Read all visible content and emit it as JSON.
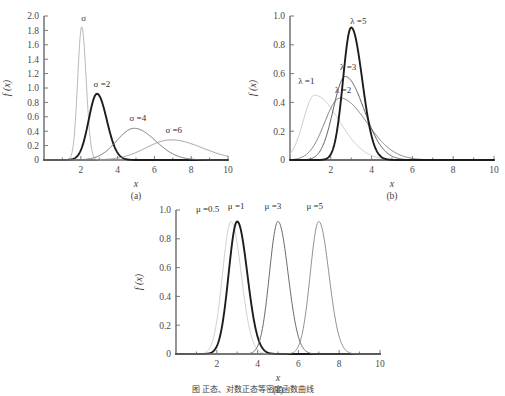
{
  "figure": {
    "caption": "图 正态、对数正态等密度函数曲线",
    "panels_order": [
      "a",
      "b",
      "c"
    ]
  },
  "chart_data": [
    {
      "id": "a",
      "type": "line",
      "title": "",
      "panel_label": "(a)",
      "xlabel": "x",
      "ylabel": "f (x)",
      "xlim": [
        0,
        10
      ],
      "ylim": [
        0,
        2.0
      ],
      "xticks": [
        2,
        4,
        6,
        8,
        10
      ],
      "xtick_labels": [
        "2",
        "4",
        "6",
        "8",
        "10"
      ],
      "yticks": [
        0,
        0.2,
        0.4,
        0.6,
        0.8,
        1.0,
        1.2,
        1.4,
        1.6,
        1.8,
        2.0
      ],
      "ytick_labels": [
        "0",
        "0.2",
        "0.4",
        "0.6",
        "0.8",
        "1.0",
        "1.2",
        "1.4",
        "1.6",
        "1.8",
        "2.0"
      ],
      "grid": false,
      "legend_position": "inline-annotations",
      "series": [
        {
          "name": "σ",
          "label": "σ",
          "peak_x": 2.05,
          "peak_y": 1.85,
          "width": 0.22,
          "skew": 0.1,
          "weight": 1.0,
          "color": "#b9b9b9",
          "label_x": 2.15,
          "label_y": 1.92
        },
        {
          "name": "σ =2",
          "label": "σ =2",
          "peak_x": 2.88,
          "peak_y": 0.92,
          "width": 0.45,
          "skew": 0.18,
          "weight": 1.9,
          "color": "#1d1d1d",
          "label_x": 3.15,
          "label_y": 1.0
        },
        {
          "name": "σ =4",
          "label": "σ =4",
          "peak_x": 4.9,
          "peak_y": 0.44,
          "width": 0.95,
          "skew": 0.22,
          "weight": 1.0,
          "color": "#6f6f6f",
          "label_x": 5.1,
          "label_y": 0.53
        },
        {
          "name": "σ =6",
          "label": "σ =6",
          "peak_x": 6.9,
          "peak_y": 0.28,
          "width": 1.35,
          "skew": 0.25,
          "weight": 0.9,
          "color": "#8f8f8f",
          "label_x": 7.05,
          "label_y": 0.36
        }
      ]
    },
    {
      "id": "b",
      "type": "line",
      "title": "",
      "panel_label": "(b)",
      "xlabel": "x",
      "ylabel": "f (x)",
      "xlim": [
        0,
        10
      ],
      "ylim": [
        0,
        1.0
      ],
      "xticks": [
        2,
        4,
        6,
        8,
        10
      ],
      "xtick_labels": [
        "2",
        "4",
        "6",
        "8",
        "10"
      ],
      "yticks": [
        0,
        0.2,
        0.4,
        0.6,
        0.8,
        1.0
      ],
      "ytick_labels": [
        "0",
        "0.2",
        "0.4",
        "0.6",
        "0.8",
        "1.0"
      ],
      "grid": false,
      "legend_position": "inline-annotations",
      "series": [
        {
          "name": "λ =1",
          "label": "λ =1",
          "peak_x": 1.2,
          "peak_y": 0.45,
          "width": 0.55,
          "skew": 1.2,
          "weight": 0.85,
          "color": "#c2c2c2",
          "label_x": 0.8,
          "label_y": 0.52
        },
        {
          "name": "λ =2",
          "label": "λ =2",
          "peak_x": 2.45,
          "peak_y": 0.43,
          "width": 0.75,
          "skew": 0.75,
          "weight": 1.0,
          "color": "#7b7b7b",
          "label_x": 2.6,
          "label_y": 0.46
        },
        {
          "name": "λ =3",
          "label": "λ =3",
          "peak_x": 2.7,
          "peak_y": 0.58,
          "width": 0.58,
          "skew": 0.6,
          "weight": 1.0,
          "color": "#5c5c5c",
          "label_x": 2.85,
          "label_y": 0.62
        },
        {
          "name": "λ =5",
          "label": "λ =5",
          "peak_x": 3.0,
          "peak_y": 0.92,
          "width": 0.4,
          "skew": 0.35,
          "weight": 1.9,
          "color": "#1d1d1d",
          "label_x": 3.35,
          "label_y": 0.94
        }
      ]
    },
    {
      "id": "c",
      "type": "line",
      "title": "",
      "panel_label": "(c)",
      "xlabel": "x",
      "ylabel": "f (x)",
      "xlim": [
        0,
        10
      ],
      "ylim": [
        0,
        1.0
      ],
      "xticks": [
        2,
        4,
        6,
        8,
        10
      ],
      "xtick_labels": [
        "2",
        "4",
        "6",
        "8",
        "10"
      ],
      "yticks": [
        0,
        0.2,
        0.4,
        0.6,
        0.8,
        1.0
      ],
      "ytick_labels": [
        "0",
        "0.2",
        "0.4",
        "0.6",
        "0.8",
        "1.0"
      ],
      "grid": false,
      "legend_position": "inline-annotations",
      "series": [
        {
          "name": "μ =0.5",
          "label": "μ =0.5",
          "peak_x": 2.7,
          "peak_y": 0.92,
          "width": 0.42,
          "skew": 0.18,
          "weight": 0.9,
          "color": "#cccccc",
          "label_x": 1.55,
          "label_y": 0.98
        },
        {
          "name": "μ =1",
          "label": "μ =1",
          "peak_x": 3.0,
          "peak_y": 0.92,
          "width": 0.42,
          "skew": 0.18,
          "weight": 1.9,
          "color": "#1d1d1d",
          "label_x": 2.95,
          "label_y": 1.0
        },
        {
          "name": "μ =3",
          "label": "μ =3",
          "peak_x": 5.0,
          "peak_y": 0.92,
          "width": 0.42,
          "skew": 0.18,
          "weight": 1.0,
          "color": "#6a6a6a",
          "label_x": 4.75,
          "label_y": 1.0
        },
        {
          "name": "μ =5",
          "label": "μ =5",
          "peak_x": 7.0,
          "peak_y": 0.92,
          "width": 0.42,
          "skew": 0.18,
          "weight": 0.95,
          "color": "#8a8a8a",
          "label_x": 6.8,
          "label_y": 1.0
        }
      ]
    }
  ]
}
